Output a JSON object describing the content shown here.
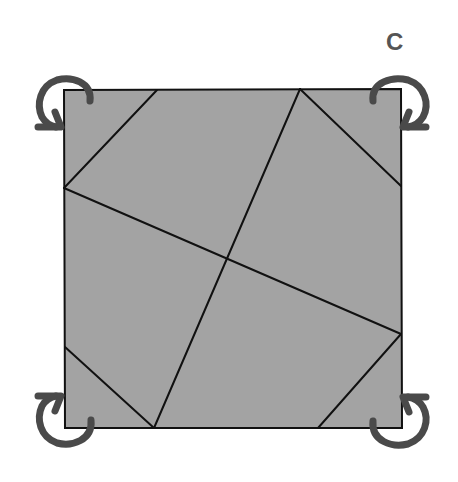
{
  "diagram": {
    "label": "C",
    "square": {
      "fill": "#a3a3a3",
      "stroke": "#111111",
      "corners": {
        "top_left": [
          64,
          90
        ],
        "top_right": [
          401,
          89
        ],
        "bottom_right": [
          402,
          428
        ],
        "bottom_left": [
          65,
          428
        ]
      }
    },
    "fold_lines": [
      {
        "from": [
          157,
          90
        ],
        "to": [
          64,
          188
        ]
      },
      {
        "from": [
          300,
          89
        ],
        "to": [
          401,
          186
        ]
      },
      {
        "from": [
          401,
          334
        ],
        "to": [
          318,
          428
        ]
      },
      {
        "from": [
          65,
          347
        ],
        "to": [
          154,
          428
        ]
      },
      {
        "from": [
          64,
          188
        ],
        "to": [
          401,
          334
        ]
      },
      {
        "from": [
          300,
          89
        ],
        "to": [
          154,
          428
        ]
      }
    ],
    "arrows": [
      {
        "corner": "top-left",
        "direction": "rotate-fold-inward"
      },
      {
        "corner": "top-right",
        "direction": "rotate-fold-inward"
      },
      {
        "corner": "bottom-left",
        "direction": "rotate-fold-inward"
      },
      {
        "corner": "bottom-right",
        "direction": "rotate-fold-inward"
      }
    ],
    "arrow_color": "#4a4a4a"
  }
}
